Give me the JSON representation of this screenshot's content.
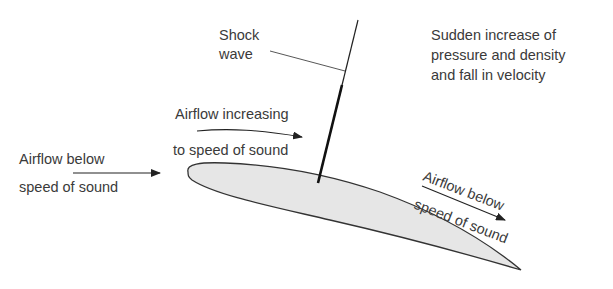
{
  "diagram": {
    "labels": {
      "shock_wave": [
        "Shock",
        "wave"
      ],
      "effect": [
        "Sudden increase of",
        "pressure and density",
        "and fall in velocity"
      ],
      "upper_airflow": [
        "Airflow increasing",
        "to speed of sound"
      ],
      "incoming_airflow": [
        "Airflow below",
        "speed of sound"
      ],
      "trailing_airflow": [
        "Airflow below",
        "speed of sound"
      ]
    },
    "colors": {
      "airfoil_fill": "#e6e6e6",
      "outline": "#333333",
      "text": "#3a3a3a"
    }
  }
}
